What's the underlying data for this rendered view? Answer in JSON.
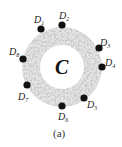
{
  "figure": {
    "center_label": "C",
    "caption": "(a)",
    "ring": {
      "cx": 62,
      "cy": 67,
      "outer_r": 40,
      "inner_r": 22,
      "texture_color": "#9a9a9a"
    },
    "dot_color": "#111111",
    "nodes": [
      {
        "name": "D",
        "sub": "1",
        "dot": [
          41,
          29
        ],
        "label": [
          34,
          15
        ]
      },
      {
        "name": "D",
        "sub": "2",
        "dot": [
          62,
          25
        ],
        "label": [
          59,
          11
        ]
      },
      {
        "name": "D",
        "sub": "3",
        "dot": [
          99,
          48
        ],
        "label": [
          100,
          38
        ]
      },
      {
        "name": "D",
        "sub": "4",
        "dot": [
          102,
          67
        ],
        "label": [
          105,
          58
        ]
      },
      {
        "name": "D",
        "sub": "5",
        "dot": [
          84,
          98
        ],
        "label": [
          87,
          100
        ]
      },
      {
        "name": "D",
        "sub": "6",
        "dot": [
          62,
          106
        ],
        "label": [
          58,
          112
        ]
      },
      {
        "name": "D",
        "sub": "7",
        "dot": [
          27,
          85
        ],
        "label": [
          18,
          92
        ]
      },
      {
        "name": "D",
        "sub": "8",
        "dot": [
          23,
          59
        ],
        "label": [
          9,
          47
        ]
      }
    ]
  }
}
